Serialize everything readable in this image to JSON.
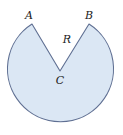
{
  "diagram": {
    "type": "circle-with-sector-removed",
    "labels": {
      "a": "A",
      "b": "B",
      "c": "C",
      "r": "R"
    },
    "colors": {
      "fill": "#dbe7f4",
      "stroke": "#5f6f92"
    }
  }
}
